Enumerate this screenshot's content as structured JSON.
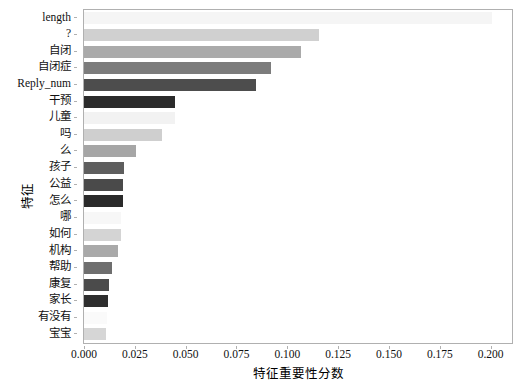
{
  "chart_data": {
    "type": "bar",
    "orientation": "horizontal",
    "title": "",
    "xlabel": "特征重要性分数",
    "ylabel": "特征",
    "xlim": [
      0.0,
      0.2105
    ],
    "xticks": [
      0.0,
      0.025,
      0.05,
      0.075,
      0.1,
      0.125,
      0.15,
      0.175,
      0.2
    ],
    "xtick_labels": [
      "0.000",
      "0.025",
      "0.050",
      "0.075",
      "0.100",
      "0.125",
      "0.150",
      "0.175",
      "0.200"
    ],
    "grid": false,
    "legend": null,
    "categories": [
      "length",
      "?",
      "自闭",
      "自闭症",
      "Reply_num",
      "干预",
      "儿童",
      "吗",
      "么",
      "孩子",
      "公益",
      "怎么",
      "哪",
      "如何",
      "机构",
      "帮助",
      "康复",
      "家长",
      "有没有",
      "宝宝"
    ],
    "values": [
      0.2005,
      0.1155,
      0.1065,
      0.092,
      0.0845,
      0.045,
      0.045,
      0.0383,
      0.0258,
      0.0196,
      0.0192,
      0.019,
      0.0184,
      0.018,
      0.0166,
      0.0136,
      0.0122,
      0.012,
      0.0112,
      0.011
    ],
    "bar_colors": [
      "#f5f5f5",
      "#d0d0d0",
      "#aaaaaa",
      "#7c7c7c",
      "#4d4d4d",
      "#2b2b2b",
      "#f2f2f2",
      "#cfcfcf",
      "#a6a6a6",
      "#5e5e5e",
      "#4a4a4a",
      "#2a2a2a",
      "#f7f7f7",
      "#d4d4d4",
      "#a9a9a9",
      "#6e6e6e",
      "#4b4b4b",
      "#2e2e2e",
      "#fafafa",
      "#d6d6d6"
    ]
  }
}
